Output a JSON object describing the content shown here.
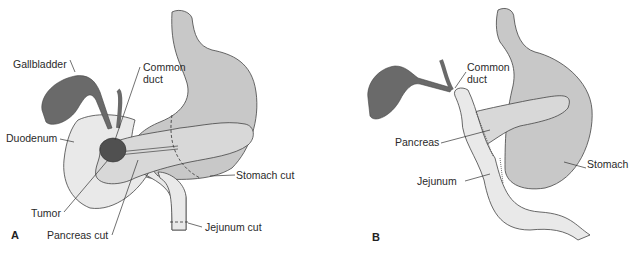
{
  "colors": {
    "stomach": "#c8c8c8",
    "intestine": "#e9e9e9",
    "pancreas": "#d8d8d8",
    "gallbladder": "#6a6a6a",
    "tumor": "#505050",
    "outline": "#444444"
  },
  "panel_a": {
    "letter": "A",
    "labels": {
      "gallbladder": "Gallbladder",
      "common_duct_1": "Common",
      "common_duct_2": "duct",
      "duodenum": "Duodenum",
      "stomach_cut": "Stomach cut",
      "tumor": "Tumor",
      "pancreas_cut": "Pancreas cut",
      "jejunum_cut": "Jejunum cut"
    }
  },
  "panel_b": {
    "letter": "B",
    "labels": {
      "common_duct_1": "Common",
      "common_duct_2": "duct",
      "pancreas": "Pancreas",
      "stomach": "Stomach",
      "jejunum": "Jejunum"
    }
  }
}
